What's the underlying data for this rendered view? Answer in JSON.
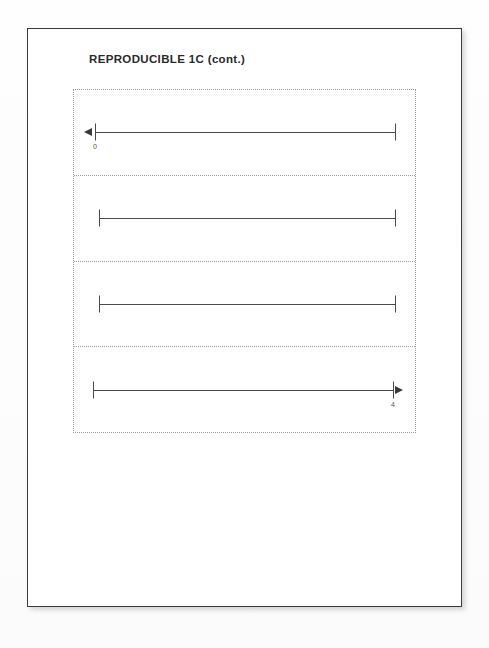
{
  "document": {
    "title": "REPRODUCIBLE 1C (cont.)",
    "page_background_color": "#ffffff",
    "page_border_color": "#3b3b3b",
    "backdrop_color": "#fdfdfd",
    "ink_color": "#4a4a4a",
    "dotted_border_color": "#9a9a9a"
  },
  "worksheet": {
    "rows": [
      {
        "name": "number-line-1",
        "left_end": "arrow",
        "right_end": "tick",
        "left_label": "0",
        "right_label": ""
      },
      {
        "name": "number-line-2",
        "left_end": "tick",
        "right_end": "tick",
        "left_label": "",
        "right_label": ""
      },
      {
        "name": "number-line-3",
        "left_end": "tick",
        "right_end": "tick",
        "left_label": "",
        "right_label": ""
      },
      {
        "name": "number-line-4",
        "left_end": "tick",
        "right_end": "arrow",
        "left_label": "",
        "right_label": "4"
      }
    ]
  }
}
